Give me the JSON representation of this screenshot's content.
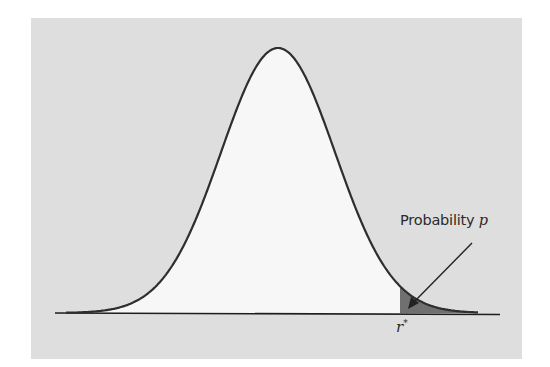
{
  "diagram": {
    "type": "normal-distribution-tail",
    "annotation": {
      "text": "Probability ",
      "variable": "p"
    },
    "threshold_label": {
      "symbol": "r",
      "superscript": "*"
    },
    "colors": {
      "background_panel": "#dedede",
      "curve_fill": "#f7f7f7",
      "curve_stroke": "#2e2e2e",
      "tail_fill": "#707070",
      "axis": "#1e1e1e"
    },
    "geometry": {
      "peak_x": 278,
      "peak_y": 48,
      "baseline_y": 313,
      "sigma_px": 57,
      "tail_start_x": 400,
      "curve_start_x": 66,
      "curve_end_x": 478,
      "axis_start_x": 55,
      "axis_end_x": 500
    }
  }
}
